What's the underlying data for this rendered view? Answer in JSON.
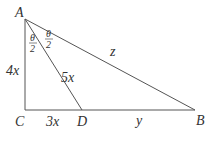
{
  "diagram": {
    "type": "right-triangle-with-angle-bisector",
    "stroke_color": "#555555",
    "background": "#ffffff",
    "vertices": {
      "A": {
        "label": "A",
        "x": 25,
        "y": 19
      },
      "B": {
        "label": "B",
        "x": 195,
        "y": 110
      },
      "C": {
        "label": "C",
        "x": 25,
        "y": 110
      },
      "D": {
        "label": "D",
        "x": 82,
        "y": 110
      }
    },
    "segments": [
      {
        "from": "A",
        "to": "C",
        "label": "4x"
      },
      {
        "from": "C",
        "to": "D",
        "label": "3x"
      },
      {
        "from": "D",
        "to": "B",
        "label": "y"
      },
      {
        "from": "A",
        "to": "D",
        "label": "5x"
      },
      {
        "from": "A",
        "to": "B",
        "label": "z"
      }
    ],
    "angle_labels": [
      {
        "numerator": "θ",
        "denominator": "2",
        "position": "left"
      },
      {
        "numerator": "θ",
        "denominator": "2",
        "position": "right"
      }
    ],
    "labels": {
      "A": "A",
      "B": "B",
      "C": "C",
      "D": "D",
      "AC": "4x",
      "CD": "3x",
      "DB": "y",
      "AD": "5x",
      "AB": "z",
      "theta": "θ",
      "two": "2"
    }
  }
}
